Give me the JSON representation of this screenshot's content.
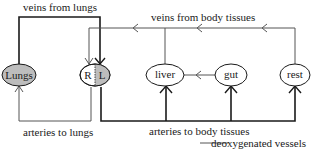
{
  "labels": {
    "veins_from_lungs": "veins from lungs",
    "veins_from_body_tissues": "veins from body tissues",
    "arteries_to_lungs": "arteries to lungs",
    "arteries_to_body_tissues": "arteries to body tissues",
    "legend": "deoxygenated vessels"
  },
  "nodes": {
    "lungs": "Lungs",
    "heart_right": "R",
    "heart_left": "L",
    "liver": "liver",
    "gut": "gut",
    "rest": "rest"
  },
  "colors": {
    "line": "#1a1a1a",
    "deoxygenated_line": "#555555",
    "shaded_fill": "#bdbdbd",
    "background": "#ffffff"
  }
}
